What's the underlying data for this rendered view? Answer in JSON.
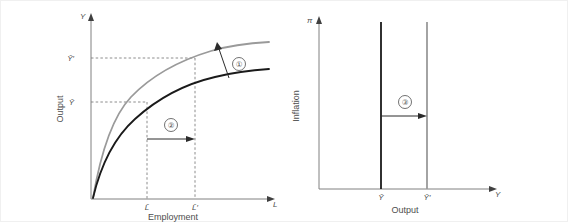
{
  "figure": {
    "title": "",
    "panels": [
      {
        "id": "production-function",
        "name": "Production function panel",
        "y_axis": {
          "symbol": "Y",
          "label": "Output"
        },
        "x_axis": {
          "symbol": "L",
          "label": "Employment"
        },
        "y_ticks": [
          {
            "id": "y-bar",
            "label": "Ȳ"
          },
          {
            "id": "y-bar-prime",
            "label": "Ȳ′"
          }
        ],
        "x_ticks": [
          {
            "id": "l-bar",
            "label": "L̄"
          },
          {
            "id": "l-bar-prime",
            "label": "L̄′"
          }
        ],
        "curves": [
          {
            "id": "production-original",
            "color": "#1a1a1a",
            "style": "solid"
          },
          {
            "id": "production-shifted",
            "color": "#9a9a9a",
            "style": "solid"
          }
        ],
        "annotations": [
          {
            "id": "annotation-1",
            "label": "①",
            "direction": "up",
            "meaning": "upward shift of production function"
          },
          {
            "id": "annotation-2",
            "label": "②",
            "direction": "right",
            "meaning": "increase in employment from L̄ to L̄′"
          }
        ]
      },
      {
        "id": "potential-output",
        "name": "Potential output panel",
        "y_axis": {
          "symbol": "π",
          "label": "Inflation"
        },
        "x_axis": {
          "symbol": "Y",
          "label": "Output"
        },
        "x_ticks": [
          {
            "id": "y-bar",
            "label": "Ȳ"
          },
          {
            "id": "y-bar-prime",
            "label": "Ȳ′"
          }
        ],
        "lines": [
          {
            "id": "potential-original",
            "color": "#1a1a1a",
            "style": "solid"
          },
          {
            "id": "potential-shifted",
            "color": "#9a9a9a",
            "style": "solid"
          }
        ],
        "annotations": [
          {
            "id": "annotation-3",
            "label": "③",
            "direction": "right",
            "meaning": "rightward shift of potential output"
          }
        ]
      }
    ],
    "colors": {
      "original": "#1a1a1a",
      "shifted": "#9a9a9a",
      "axis": "#808080",
      "text": "#4d4d4d",
      "frame": "#f0f0f0"
    }
  }
}
